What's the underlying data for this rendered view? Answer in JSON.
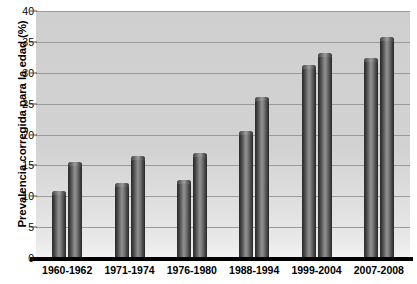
{
  "chart_data": {
    "type": "bar",
    "title": "",
    "xlabel": "",
    "ylabel": "Prevalencia corregida para la edad (%)",
    "ylim": [
      0,
      40
    ],
    "ytick_step": 5,
    "yticks": [
      "40",
      "35",
      "30",
      "25",
      "20",
      "15",
      "10",
      "5",
      "0"
    ],
    "grid": true,
    "legend": "none",
    "categories": [
      "1960-1962",
      "1971-1974",
      "1976-1980",
      "1988-1994",
      "1999-2004",
      "2007-2008"
    ],
    "series": [
      {
        "name": "series-1",
        "values": [
          10.8,
          12.2,
          12.6,
          20.6,
          31.2,
          32.4
        ]
      },
      {
        "name": "series-2",
        "values": [
          15.6,
          16.5,
          17.0,
          26.0,
          33.2,
          35.8
        ]
      }
    ],
    "colors": {
      "plot_background": "#d2d2d2",
      "gridline": "#9a9a9a",
      "bar_dark": "#2b2b2b",
      "bar_light": "#8f8f8f",
      "axis": "#000000",
      "text": "#000000"
    }
  }
}
